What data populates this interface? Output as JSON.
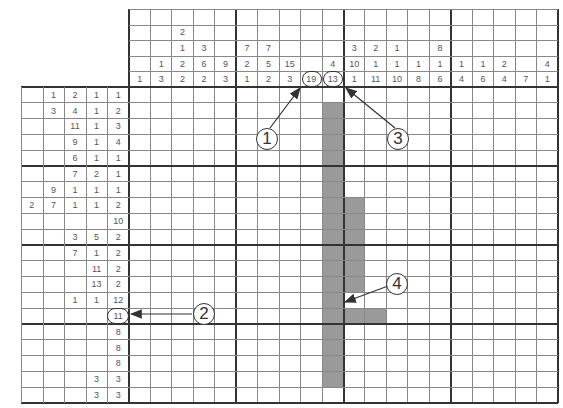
{
  "puzzle": {
    "rows": 20,
    "cols": 20,
    "column_clues": [
      [
        "1"
      ],
      [
        "3"
      ],
      [
        "2",
        "1",
        "2",
        "2"
      ],
      [
        "3",
        "6",
        "2"
      ],
      [
        "9",
        "3"
      ],
      [
        "7",
        "2",
        "1"
      ],
      [
        "7",
        "5",
        "2"
      ],
      [
        "15",
        "3"
      ],
      [
        "19"
      ],
      [
        "4",
        "13"
      ],
      [
        "3",
        "10",
        "1"
      ],
      [
        "2",
        "1",
        "11"
      ],
      [
        "1",
        "1",
        "10"
      ],
      [
        "1",
        "8"
      ],
      [
        "8",
        "1",
        "6"
      ],
      [
        "1",
        "4"
      ],
      [
        "1",
        "6"
      ],
      [
        "2",
        "4"
      ],
      [
        "7"
      ],
      [
        "4",
        "1"
      ]
    ],
    "column_clues_display": [
      [
        "",
        "",
        "",
        "",
        "1"
      ],
      [
        "",
        "",
        "",
        "1",
        "3"
      ],
      [
        "",
        "2",
        "1",
        "2",
        "2"
      ],
      [
        "",
        "",
        "3",
        "6",
        "2"
      ],
      [
        "",
        "",
        "",
        "9",
        "3"
      ],
      [
        "",
        "",
        "7",
        "2",
        "1"
      ],
      [
        "",
        "",
        "7",
        "5",
        "2"
      ],
      [
        "",
        "",
        "",
        "15",
        "3"
      ],
      [
        "",
        "",
        "",
        "",
        "19"
      ],
      [
        "",
        "",
        "",
        "4",
        "13"
      ],
      [
        "",
        "",
        "3",
        "10",
        "1"
      ],
      [
        "",
        "",
        "2",
        "1",
        "11"
      ],
      [
        "",
        "",
        "1",
        "1",
        "10"
      ],
      [
        "",
        "",
        "",
        "1",
        "8"
      ],
      [
        "",
        "",
        "8",
        "1",
        "6"
      ],
      [
        "",
        "",
        "",
        "1",
        "4"
      ],
      [
        "",
        "",
        "",
        "1",
        "6"
      ],
      [
        "",
        "",
        "",
        "2",
        "4"
      ],
      [
        "",
        "",
        "",
        "",
        "7"
      ],
      [
        "",
        "",
        "",
        "4",
        "1"
      ]
    ],
    "row_clues_display": [
      [
        "",
        "1",
        "2",
        "1",
        "1"
      ],
      [
        "",
        "3",
        "4",
        "1",
        "2"
      ],
      [
        "",
        "",
        "11",
        "1",
        "3"
      ],
      [
        "",
        "",
        "9",
        "1",
        "4"
      ],
      [
        "",
        "",
        "6",
        "1",
        "1"
      ],
      [
        "",
        "",
        "7",
        "2",
        "1"
      ],
      [
        "",
        "9",
        "1",
        "1",
        "1"
      ],
      [
        "2",
        "7",
        "1",
        "1",
        "2"
      ],
      [
        "",
        "",
        "",
        "",
        "10"
      ],
      [
        "",
        "",
        "3",
        "5",
        "2"
      ],
      [
        "",
        "",
        "7",
        "1",
        "2"
      ],
      [
        "",
        "",
        "",
        "11",
        "2"
      ],
      [
        "",
        "",
        "",
        "13",
        "2"
      ],
      [
        "",
        "",
        "1",
        "1",
        "12"
      ],
      [
        "",
        "",
        "",
        "",
        "11"
      ],
      [
        "",
        "",
        "",
        "",
        "8"
      ],
      [
        "",
        "",
        "",
        "",
        "8"
      ],
      [
        "",
        "",
        "",
        "",
        "8"
      ],
      [
        "",
        "",
        "",
        "3",
        "3"
      ],
      [
        "",
        "",
        "",
        "3",
        "3"
      ]
    ],
    "shaded_cells": [
      [
        1,
        9
      ],
      [
        2,
        9
      ],
      [
        3,
        9
      ],
      [
        4,
        9
      ],
      [
        5,
        9
      ],
      [
        6,
        9
      ],
      [
        7,
        9
      ],
      [
        8,
        9
      ],
      [
        9,
        9
      ],
      [
        10,
        9
      ],
      [
        11,
        9
      ],
      [
        12,
        9
      ],
      [
        13,
        9
      ],
      [
        14,
        9
      ],
      [
        15,
        9
      ],
      [
        16,
        9
      ],
      [
        17,
        9
      ],
      [
        18,
        9
      ],
      [
        7,
        10
      ],
      [
        8,
        10
      ],
      [
        9,
        10
      ],
      [
        10,
        10
      ],
      [
        11,
        10
      ],
      [
        12,
        10
      ],
      [
        14,
        10
      ],
      [
        14,
        11
      ]
    ],
    "highlighted_clues": {
      "col_19": "19",
      "col_13": "13",
      "row_11": "11"
    },
    "annotations": [
      {
        "label": "1",
        "target": "column clue 19"
      },
      {
        "label": "2",
        "target": "row clue 11"
      },
      {
        "label": "3",
        "target": "column clue 13"
      },
      {
        "label": "4",
        "target": "blank cell in column 11"
      }
    ],
    "colors": {
      "shade": "#9a9a9a",
      "thick_line": "#333333",
      "thin_line": "#888888",
      "clue_text": "#555555"
    }
  }
}
